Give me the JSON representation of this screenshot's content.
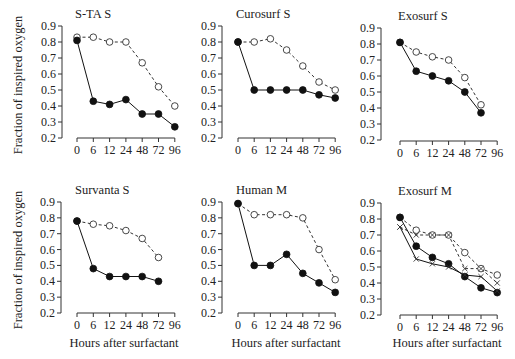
{
  "ylabel": "Fraction of inspired oxygen",
  "xlabel": "Hours after surfactant",
  "colors": {
    "ink": "#111111",
    "dashed_ink": "#333333",
    "background": "#ffffff"
  },
  "chart_data": [
    {
      "type": "line",
      "title": "S-TA S",
      "xlabel": "",
      "ylabel": "Fraction of inspired oxygen",
      "categories": [
        "0",
        "6",
        "12",
        "24",
        "48",
        "72",
        "96"
      ],
      "ylim": [
        0.2,
        0.9
      ],
      "yticks": [
        "0.9",
        "0.8",
        "0.7",
        "0.6",
        "0.5",
        "0.4",
        "0.3",
        "0.2"
      ],
      "grid": false,
      "series": [
        {
          "name": "filled-solid",
          "style": "solid",
          "marker": "filled-circle",
          "values": [
            0.81,
            0.43,
            0.41,
            0.44,
            0.35,
            0.35,
            0.27
          ]
        },
        {
          "name": "open-dashed",
          "style": "dashed",
          "marker": "open-circle",
          "values": [
            0.83,
            0.83,
            0.8,
            0.8,
            0.67,
            0.52,
            0.4
          ]
        }
      ]
    },
    {
      "type": "line",
      "title": "Curosurf S",
      "xlabel": "",
      "ylabel": "",
      "categories": [
        "0",
        "6",
        "12",
        "24",
        "48",
        "72",
        "96"
      ],
      "ylim": [
        0.2,
        0.9
      ],
      "yticks": [
        "0.9",
        "0.8",
        "0.7",
        "0.6",
        "0.5",
        "0.4",
        "0.3",
        "0.2"
      ],
      "grid": false,
      "series": [
        {
          "name": "filled-solid",
          "style": "solid",
          "marker": "filled-circle",
          "values": [
            0.8,
            0.5,
            0.5,
            0.5,
            0.5,
            0.47,
            0.45
          ]
        },
        {
          "name": "open-dashed",
          "style": "dashed",
          "marker": "open-circle",
          "values": [
            0.8,
            0.8,
            0.82,
            0.75,
            0.65,
            0.55,
            0.5
          ]
        }
      ]
    },
    {
      "type": "line",
      "title": "Exosurf S",
      "xlabel": "",
      "ylabel": "",
      "categories": [
        "0",
        "6",
        "12",
        "24",
        "48",
        "72",
        "96"
      ],
      "ylim": [
        0.2,
        0.9
      ],
      "yticks": [
        "0.9",
        "0.8",
        "0.7",
        "0.6",
        "0.5",
        "0.4",
        "0.3",
        "0.2"
      ],
      "grid": false,
      "series": [
        {
          "name": "filled-solid",
          "style": "solid",
          "marker": "filled-circle",
          "values": [
            0.81,
            0.63,
            0.6,
            0.57,
            0.5,
            0.37,
            null
          ]
        },
        {
          "name": "open-dashed",
          "style": "dashed",
          "marker": "open-circle",
          "values": [
            0.81,
            0.75,
            0.72,
            0.7,
            0.59,
            0.42,
            null
          ]
        }
      ]
    },
    {
      "type": "line",
      "title": "Survanta S",
      "xlabel": "Hours after surfactant",
      "ylabel": "Fraction of inspired oxygen",
      "categories": [
        "0",
        "6",
        "12",
        "24",
        "48",
        "72",
        "96"
      ],
      "ylim": [
        0.2,
        0.9
      ],
      "yticks": [
        "0.9",
        "0.8",
        "0.7",
        "0.6",
        "0.5",
        "0.4",
        "0.3",
        "0.2"
      ],
      "grid": false,
      "series": [
        {
          "name": "filled-solid",
          "style": "solid",
          "marker": "filled-circle",
          "values": [
            0.78,
            0.48,
            0.43,
            0.43,
            0.43,
            0.4,
            null
          ]
        },
        {
          "name": "open-dashed",
          "style": "dashed",
          "marker": "open-circle",
          "values": [
            0.78,
            0.76,
            0.75,
            0.72,
            0.67,
            0.55,
            null
          ]
        }
      ]
    },
    {
      "type": "line",
      "title": "Human M",
      "xlabel": "Hours after surfactant",
      "ylabel": "",
      "categories": [
        "0",
        "6",
        "12",
        "24",
        "48",
        "72",
        "96"
      ],
      "ylim": [
        0.2,
        0.9
      ],
      "yticks": [
        "0.9",
        "0.8",
        "0.7",
        "0.6",
        "0.5",
        "0.4",
        "0.3",
        "0.2"
      ],
      "grid": false,
      "series": [
        {
          "name": "filled-solid",
          "style": "solid",
          "marker": "filled-circle",
          "values": [
            0.89,
            0.5,
            0.5,
            0.57,
            0.45,
            0.39,
            0.33
          ]
        },
        {
          "name": "open-dashed",
          "style": "dashed",
          "marker": "open-circle",
          "values": [
            0.89,
            0.82,
            0.82,
            0.82,
            0.8,
            0.6,
            0.41
          ]
        }
      ]
    },
    {
      "type": "line",
      "title": "Exosurf M",
      "xlabel": "Hours after surfactant",
      "ylabel": "",
      "categories": [
        "0",
        "6",
        "12",
        "24",
        "48",
        "72",
        "96"
      ],
      "ylim": [
        0.2,
        0.9
      ],
      "yticks": [
        "0.9",
        "0.8",
        "0.7",
        "0.6",
        "0.5",
        "0.4",
        "0.3",
        "0.2"
      ],
      "grid": false,
      "series": [
        {
          "name": "filled-solid",
          "style": "solid",
          "marker": "filled-circle",
          "values": [
            0.81,
            0.63,
            0.56,
            0.52,
            0.44,
            0.37,
            0.34
          ]
        },
        {
          "name": "cross-solid",
          "style": "solid",
          "marker": "cross",
          "values": [
            0.75,
            0.55,
            0.52,
            0.5,
            0.45,
            0.44,
            0.35
          ]
        },
        {
          "name": "open-dashed",
          "style": "dashed",
          "marker": "open-circle",
          "values": [
            0.81,
            0.73,
            0.7,
            0.7,
            0.59,
            0.49,
            0.45
          ]
        },
        {
          "name": "cross-dashed",
          "style": "dashed",
          "marker": "cross",
          "values": [
            0.75,
            0.7,
            0.7,
            0.7,
            0.49,
            0.49,
            0.4
          ]
        }
      ]
    }
  ]
}
